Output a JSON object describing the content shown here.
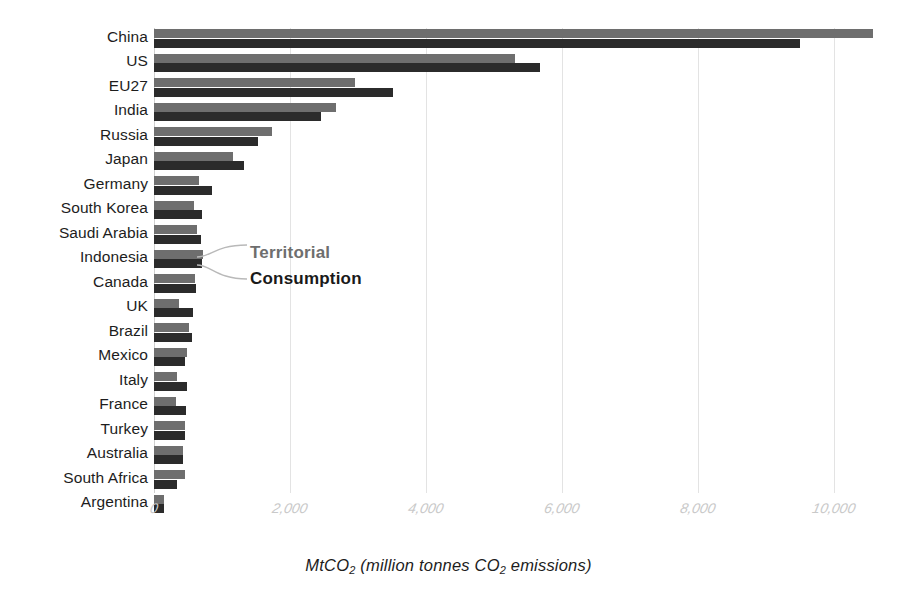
{
  "chart_data": {
    "type": "bar",
    "orientation": "horizontal",
    "title": "",
    "subtitle": "",
    "xlabel": "MtCO2 (million tonnes CO2 emissions)",
    "ylabel": "",
    "xlim": [
      0,
      10800
    ],
    "grid": "vertical-only",
    "legend_position": "inline-annotation",
    "xticks": [
      0,
      2000,
      4000,
      6000,
      8000,
      10000
    ],
    "xtick_labels": [
      "0",
      "2,000",
      "4,000",
      "6,000",
      "8,000",
      "10,000"
    ],
    "categories": [
      "China",
      "US",
      "EU27",
      "India",
      "Russia",
      "Japan",
      "Germany",
      "South Korea",
      "Saudi Arabia",
      "Indonesia",
      "Canada",
      "UK",
      "Brazil",
      "Mexico",
      "Italy",
      "France",
      "Turkey",
      "Australia",
      "South Africa",
      "Argentina"
    ],
    "series": [
      {
        "name": "Territorial",
        "color": "#6e6e6e",
        "values": [
          10570,
          5310,
          2960,
          2680,
          1735,
          1160,
          660,
          590,
          625,
          725,
          600,
          370,
          520,
          490,
          345,
          325,
          455,
          430,
          455,
          150
        ]
      },
      {
        "name": "Consumption",
        "color": "#2b2b2b",
        "values": [
          9500,
          5675,
          3515,
          2455,
          1530,
          1325,
          850,
          710,
          685,
          710,
          620,
          570,
          555,
          455,
          480,
          470,
          455,
          430,
          345,
          150
        ]
      }
    ],
    "annotations": [
      {
        "text": "Territorial",
        "color": "#6e6e6e"
      },
      {
        "text": "Consumption",
        "color": "#1a1a1a"
      }
    ]
  },
  "axis": {
    "x_title_main": "MtCO",
    "x_title_sub": "2",
    "x_title_rest": " (million tonnes CO",
    "x_title_sub2": "2",
    "x_title_tail": " emissions)"
  }
}
